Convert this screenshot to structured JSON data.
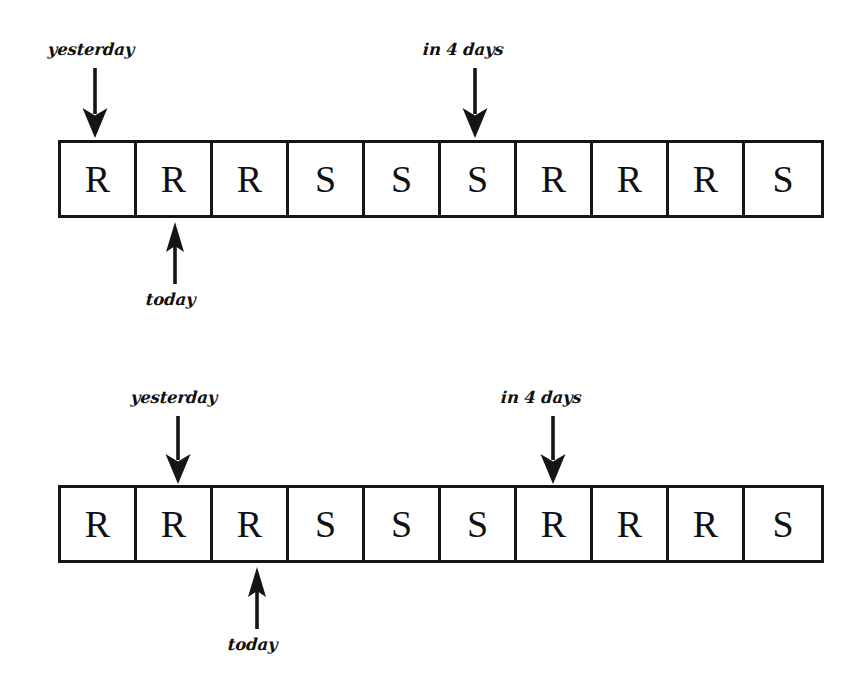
{
  "figure": {
    "background_color": "#ffffff",
    "ink_color": "#111111",
    "cell_count": 10,
    "symbols_legend": {
      "R": "R",
      "S": "S"
    }
  },
  "strips": [
    {
      "id": "strip-top",
      "cells": [
        "R",
        "R",
        "R",
        "S",
        "S",
        "S",
        "R",
        "R",
        "R",
        "S"
      ],
      "markers": [
        {
          "name": "yesterday",
          "label": "yesterday",
          "direction": "down",
          "cell_index": 1
        },
        {
          "name": "in-4-days",
          "label": "in 4 days",
          "direction": "down",
          "cell_index": 6
        },
        {
          "name": "today",
          "label": "today",
          "direction": "up",
          "cell_index": 2
        }
      ]
    },
    {
      "id": "strip-bottom",
      "cells": [
        "R",
        "R",
        "R",
        "S",
        "S",
        "S",
        "R",
        "R",
        "R",
        "S"
      ],
      "markers": [
        {
          "name": "yesterday",
          "label": "yesterday",
          "direction": "down",
          "cell_index": 2
        },
        {
          "name": "in-4-days",
          "label": "in 4 days",
          "direction": "down",
          "cell_index": 7
        },
        {
          "name": "today",
          "label": "today",
          "direction": "up",
          "cell_index": 3
        }
      ]
    }
  ]
}
